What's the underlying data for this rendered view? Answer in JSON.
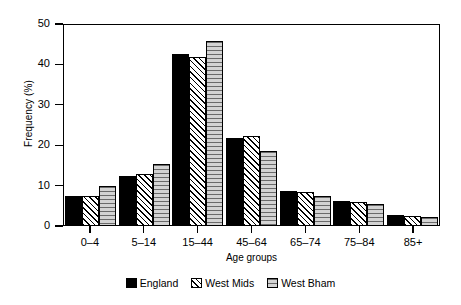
{
  "chart_data": {
    "type": "bar",
    "title": "",
    "xlabel": "Age groups",
    "ylabel": "Frequency (%)",
    "categories": [
      "0–4",
      "5–14",
      "15–44",
      "45–64",
      "65–74",
      "75–84",
      "85+"
    ],
    "series": [
      {
        "name": "England",
        "values": [
          7.1,
          12.1,
          42.3,
          21.5,
          8.4,
          6.0,
          2.5
        ]
      },
      {
        "name": "West Mids",
        "values": [
          7.2,
          12.7,
          41.7,
          22.0,
          8.2,
          5.6,
          2.3
        ]
      },
      {
        "name": "West Bham",
        "values": [
          9.7,
          15.2,
          45.5,
          18.4,
          7.1,
          5.3,
          2.1
        ]
      }
    ],
    "ylim": [
      0,
      50
    ],
    "yticks": [
      0,
      10,
      20,
      30,
      40,
      50
    ],
    "ytick_labels": [
      "0",
      "10",
      "20",
      "30",
      "40",
      "50"
    ],
    "grid": false,
    "legend_position": "below",
    "legend": [
      {
        "label": "England",
        "fill": "solid-black"
      },
      {
        "label": "West Mids",
        "fill": "diagonal-hatch"
      },
      {
        "label": "West Bham",
        "fill": "grey-horizontal-lines"
      }
    ],
    "colors": {
      "england": "#000000",
      "west_mids": "#ffffff",
      "west_bham": "#c9c9c9",
      "axis": "#000000",
      "background": "#ffffff"
    }
  }
}
